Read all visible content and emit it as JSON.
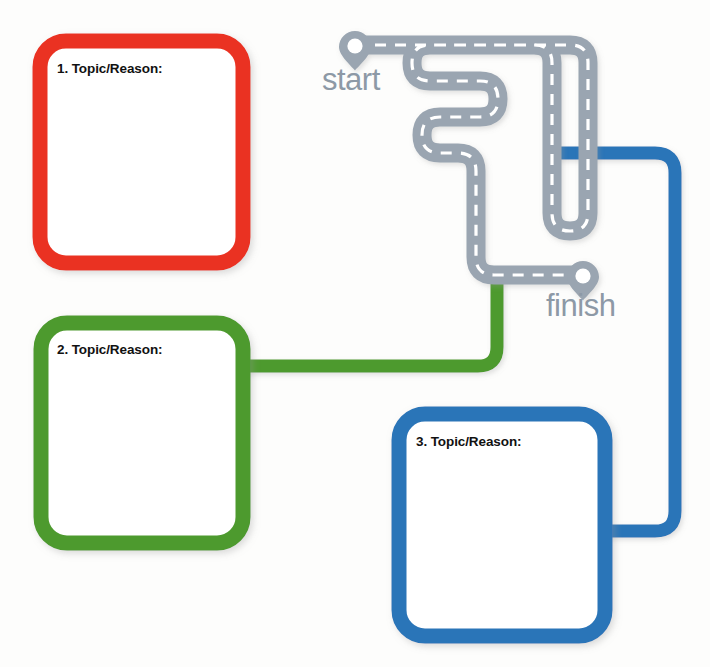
{
  "diagram": {
    "background_color": "#fdfdfc"
  },
  "road": {
    "color": "#9aa5b1",
    "dash_color": "#ffffff",
    "start_marker": {
      "name": "start-pin",
      "label": "start",
      "label_color": "#8d99a6"
    },
    "finish_marker": {
      "name": "finish-pin",
      "label": "finish",
      "label_color": "#8d99a6"
    }
  },
  "boxes": [
    {
      "id": "box-1",
      "label": "1. Topic/Reason:",
      "color": "#ea3323",
      "fill": "#ffffff"
    },
    {
      "id": "box-2",
      "label": "2. Topic/Reason:",
      "color": "#4e9a2f",
      "fill": "#ffffff"
    },
    {
      "id": "box-3",
      "label": "3. Topic/Reason:",
      "color": "#2c75b8",
      "fill": "#ffffff"
    }
  ],
  "connectors": [
    {
      "id": "connector-1",
      "from": "box-1",
      "to": "road",
      "color": "#ea3323"
    },
    {
      "id": "connector-2",
      "from": "box-2",
      "to": "road",
      "color": "#4e9a2f"
    },
    {
      "id": "connector-3",
      "from": "road",
      "to": "box-3",
      "color": "#2c75b8"
    }
  ]
}
